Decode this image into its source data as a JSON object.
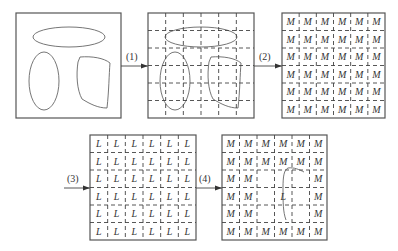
{
  "diagram": {
    "steps": [
      {
        "id": "step1",
        "label": "(1)"
      },
      {
        "id": "step2",
        "label": "(2)"
      },
      {
        "id": "step3",
        "label": "(3)"
      },
      {
        "id": "step4",
        "label": "(4)"
      }
    ],
    "panels": [
      {
        "id": "original-image",
        "description": "Image with three closed regions: horizontal ellipse, vertical ellipse, rounded quadrilateral"
      },
      {
        "id": "grid-overlay",
        "description": "Image partitioned by 6x6 grid (dashed lines) over regions"
      },
      {
        "id": "m-labeled-grid",
        "grid": 6,
        "letter": "M"
      },
      {
        "id": "l-labeled-grid",
        "grid": 6,
        "letter": "L"
      },
      {
        "id": "mixed-grid",
        "grid": 6,
        "letter_outer": "M",
        "letter_inner": "L"
      }
    ],
    "grid_letters": {
      "m": "M",
      "l": "L"
    },
    "mixed_grid_rows": [
      [
        "M",
        "M",
        "M",
        "M",
        "M",
        "M"
      ],
      [
        "M",
        "M",
        "M",
        "M",
        "M",
        "M"
      ],
      [
        "M",
        "M",
        "",
        "",
        "",
        "M"
      ],
      [
        "M",
        "M",
        "",
        "L",
        "",
        "M"
      ],
      [
        "M",
        "M",
        "",
        "",
        "",
        "M"
      ],
      [
        "M",
        "M",
        "M",
        "M",
        "M",
        "M"
      ]
    ]
  }
}
